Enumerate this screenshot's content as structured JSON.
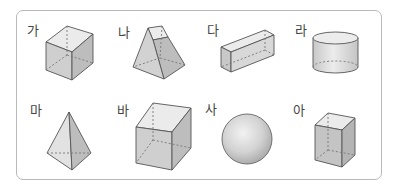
{
  "figure": {
    "items": [
      {
        "label": "가",
        "shape": "cube"
      },
      {
        "label": "나",
        "shape": "square-frustum"
      },
      {
        "label": "다",
        "shape": "rectangular-prism-lying"
      },
      {
        "label": "라",
        "shape": "cylinder"
      },
      {
        "label": "마",
        "shape": "triangular-pyramid"
      },
      {
        "label": "바",
        "shape": "cube-large"
      },
      {
        "label": "사",
        "shape": "sphere"
      },
      {
        "label": "아",
        "shape": "rectangular-prism-standing"
      }
    ],
    "colors": {
      "border": "#b9b9b9",
      "edge": "#555555",
      "face_light": "#e6e6e6",
      "face_mid": "#cfcfcf",
      "face_dark": "#b8b8b8"
    }
  }
}
